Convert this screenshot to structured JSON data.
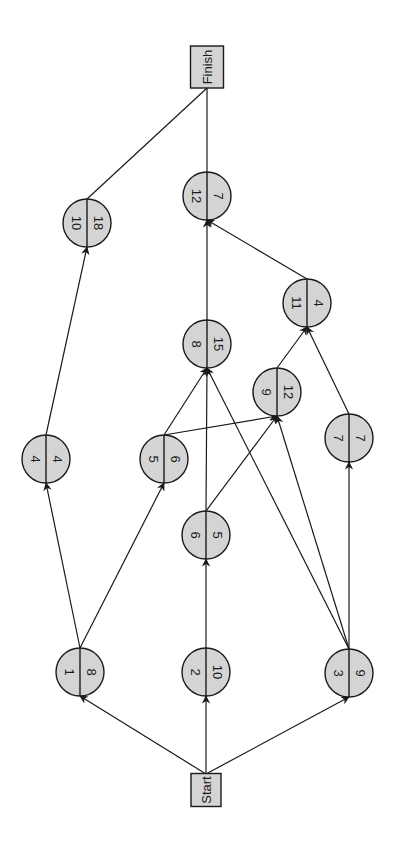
{
  "diagram": {
    "type": "activity-on-node network",
    "orientation": "rotated 90deg (Start at bottom, Finish at top)",
    "colors": {
      "node_fill": "#d4d4d4",
      "stroke": "#1a1a1a",
      "background": "#ffffff"
    },
    "terminals": {
      "start": {
        "label": "Start",
        "x": 206,
        "y": 790
      },
      "finish": {
        "label": "Finish",
        "x": 207,
        "y": 67
      }
    },
    "nodes": [
      {
        "id": "1",
        "label": "1",
        "value": "8",
        "x": 80,
        "y": 672
      },
      {
        "id": "2",
        "label": "2",
        "value": "10",
        "x": 206,
        "y": 672
      },
      {
        "id": "3",
        "label": "3",
        "value": "9",
        "x": 349,
        "y": 673
      },
      {
        "id": "4",
        "label": "4",
        "value": "4",
        "x": 46,
        "y": 459
      },
      {
        "id": "5",
        "label": "5",
        "value": "6",
        "x": 164,
        "y": 459
      },
      {
        "id": "6",
        "label": "6",
        "value": "5",
        "x": 206,
        "y": 535
      },
      {
        "id": "7",
        "label": "7",
        "value": "7",
        "x": 349,
        "y": 438
      },
      {
        "id": "8",
        "label": "8",
        "value": "15",
        "x": 207,
        "y": 344
      },
      {
        "id": "9",
        "label": "9",
        "value": "12",
        "x": 277,
        "y": 392
      },
      {
        "id": "10",
        "label": "10",
        "value": "18",
        "x": 87,
        "y": 223
      },
      {
        "id": "11",
        "label": "11",
        "value": "4",
        "x": 307,
        "y": 303
      },
      {
        "id": "12",
        "label": "12",
        "value": "7",
        "x": 207,
        "y": 196
      }
    ],
    "edges": [
      {
        "from": "Start",
        "to": "1"
      },
      {
        "from": "Start",
        "to": "2"
      },
      {
        "from": "Start",
        "to": "3"
      },
      {
        "from": "1",
        "to": "4"
      },
      {
        "from": "1",
        "to": "5"
      },
      {
        "from": "2",
        "to": "6"
      },
      {
        "from": "3",
        "to": "7"
      },
      {
        "from": "3",
        "to": "8"
      },
      {
        "from": "3",
        "to": "9"
      },
      {
        "from": "4",
        "to": "10"
      },
      {
        "from": "5",
        "to": "8"
      },
      {
        "from": "5",
        "to": "9"
      },
      {
        "from": "6",
        "to": "8"
      },
      {
        "from": "6",
        "to": "9"
      },
      {
        "from": "7",
        "to": "11"
      },
      {
        "from": "8",
        "to": "12"
      },
      {
        "from": "9",
        "to": "11"
      },
      {
        "from": "11",
        "to": "12"
      },
      {
        "from": "10",
        "to": "Finish"
      },
      {
        "from": "12",
        "to": "Finish"
      }
    ]
  }
}
